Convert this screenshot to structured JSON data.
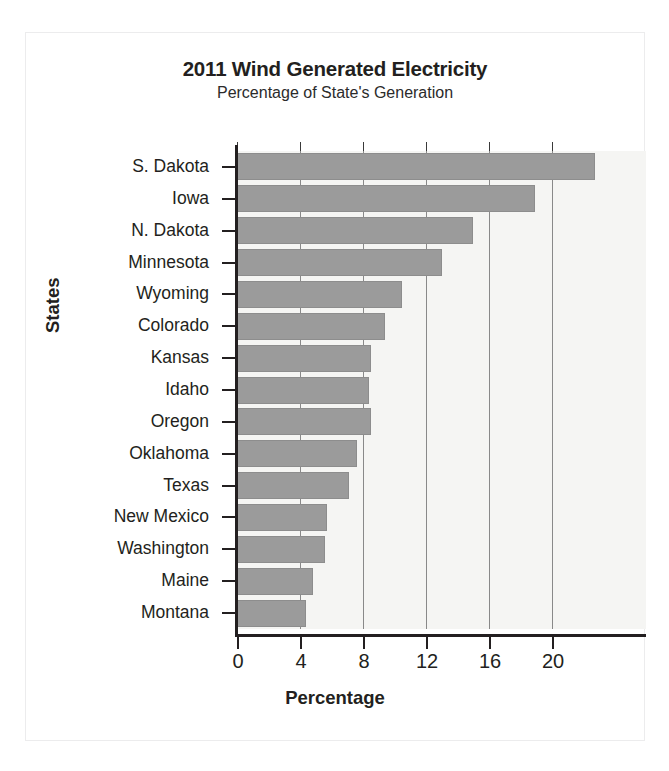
{
  "chart_data": {
    "type": "bar",
    "orientation": "horizontal",
    "title": "2011 Wind Generated Electricity",
    "subtitle": "Percentage of State's Generation",
    "xlabel": "Percentage",
    "ylabel": "States",
    "xlim": [
      0,
      23.2
    ],
    "ylim": null,
    "grid": true,
    "legend": null,
    "xticks": [
      0,
      4,
      8,
      12,
      16,
      20
    ],
    "xtick_labels": [
      "0",
      "4",
      "8",
      "12",
      "16",
      "20"
    ],
    "categories": [
      "S. Dakota",
      "Iowa",
      "N. Dakota",
      "Minnesota",
      "Wyoming",
      "Colorado",
      "Kansas",
      "Idaho",
      "Oregon",
      "Oklahoma",
      "Texas",
      "New Mexico",
      "Washington",
      "Maine",
      "Montana"
    ],
    "values": [
      22.7,
      18.9,
      15.0,
      13.0,
      10.5,
      9.4,
      8.5,
      8.4,
      8.5,
      7.6,
      7.1,
      5.7,
      5.6,
      4.8,
      4.4
    ],
    "bar_color": "#9b9b9b",
    "plot_background": "#f5f5f3",
    "axis_color": "#231f20"
  }
}
